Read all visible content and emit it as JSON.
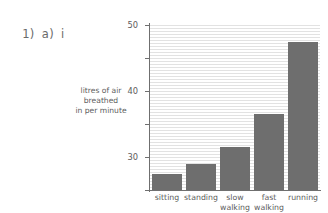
{
  "question_label": {
    "number": "1)",
    "part": "a)",
    "subpart": "i"
  },
  "chart_data": {
    "type": "bar",
    "title": "",
    "subtitle": "",
    "xlabel": "",
    "ylabel": "litres of air breathed in per minute",
    "ylabel_lines": [
      "litres of air",
      "breathed",
      "in per minute"
    ],
    "categories": [
      "sitting",
      "standing",
      "slow walking",
      "fast walking",
      "running"
    ],
    "category_lines": [
      [
        "sitting"
      ],
      [
        "standing"
      ],
      [
        "slow",
        "walking"
      ],
      [
        "fast",
        "walking"
      ],
      [
        "running"
      ]
    ],
    "values": [
      5,
      8,
      13,
      23,
      45
    ],
    "ylim": [
      0,
      50
    ],
    "yticks": [
      0,
      10,
      20,
      30,
      40,
      50
    ],
    "ytick_labels": [
      "0",
      "10",
      "20",
      "30",
      "40",
      "50"
    ],
    "grid": true,
    "legend": false,
    "bar_color": "#6e6e6e",
    "axis_color": "#6f6f6f",
    "grid_color": "#e2e2e2",
    "background_color": "#ffffff"
  }
}
